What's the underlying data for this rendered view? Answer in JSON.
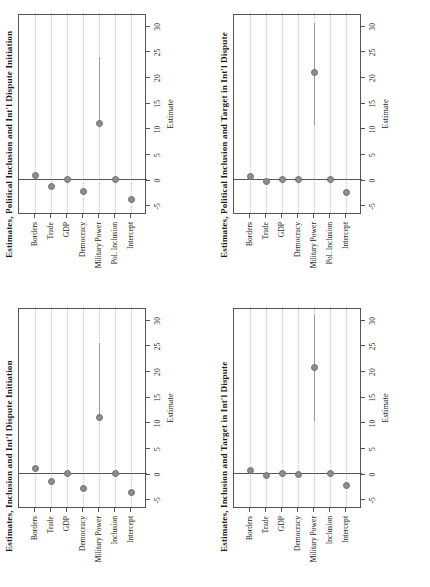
{
  "figure": {
    "orientation": "rotated-90-ccw",
    "panel_count": 4,
    "dot_color": "#8d8d8d",
    "ci_color": "#9a9a9a",
    "axis_color": "#555555",
    "grid_color": "#c9c9c9"
  },
  "axis": {
    "x_title": "Estimate",
    "ticks": [
      -5,
      0,
      5,
      10,
      15,
      20,
      25,
      30
    ],
    "tick_labels": [
      "-5",
      "0",
      "5",
      "10",
      "15",
      "20",
      "25",
      "30"
    ],
    "min": -6.5,
    "max": 32.5
  },
  "chart_data": [
    {
      "id": "panel-top-left",
      "type": "scatter",
      "title": "Estimates, Political Inclusion and Int'l Dispute Initiation",
      "xlabel": "Estimate",
      "ylabel": "",
      "xlim": [
        -6.5,
        32.5
      ],
      "grid": true,
      "categories": [
        "Borders",
        "Trade",
        "GDP",
        "Democracy",
        "Military Power",
        "Pol. Inclusion",
        "Intercept"
      ],
      "values": [
        0.9,
        -1.3,
        0.0,
        -2.3,
        11.0,
        0.0,
        -3.9
      ],
      "ci_low": [
        0.9,
        -1.3,
        0.0,
        -2.3,
        11.0,
        0.0,
        -3.9
      ],
      "ci_high": [
        0.9,
        -1.3,
        0.0,
        -2.3,
        24.0,
        0.0,
        -3.9
      ],
      "reference_line": 0
    },
    {
      "id": "panel-top-right",
      "type": "scatter",
      "title": "Estimates, Political Inclusion and Target in Int'l Dispute",
      "xlabel": "Estimate",
      "ylabel": "",
      "xlim": [
        -6.5,
        32.5
      ],
      "grid": true,
      "categories": [
        "Borders",
        "Trade",
        "GDP",
        "Democracy",
        "Military Power",
        "Pol. Inclusion",
        "Intercept"
      ],
      "values": [
        0.6,
        -0.3,
        0.0,
        0.0,
        20.8,
        0.0,
        -2.6
      ],
      "ci_low": [
        0.6,
        -0.3,
        0.0,
        0.0,
        10.5,
        0.0,
        -2.6
      ],
      "ci_high": [
        0.6,
        -0.3,
        0.0,
        0.0,
        30.5,
        0.0,
        -2.6
      ],
      "reference_line": 0
    },
    {
      "id": "panel-bottom-left",
      "type": "scatter",
      "title": "Estimates, Inclusion and Int'l Dispute Initiation",
      "xlabel": "Estimate",
      "ylabel": "",
      "xlim": [
        -6.5,
        32.5
      ],
      "grid": true,
      "categories": [
        "Borders",
        "Trade",
        "GDP",
        "Democracy",
        "Military Power",
        "Inclusion",
        "Intercept"
      ],
      "values": [
        1.0,
        -1.6,
        0.0,
        -2.9,
        11.0,
        0.0,
        -3.7
      ],
      "ci_low": [
        1.0,
        -1.6,
        0.0,
        -2.9,
        11.0,
        0.0,
        -3.7
      ],
      "ci_high": [
        1.0,
        -1.6,
        0.0,
        -2.9,
        25.5,
        0.0,
        -3.7
      ],
      "reference_line": 0
    },
    {
      "id": "panel-bottom-right",
      "type": "scatter",
      "title": "Estimates, Inclusion and Target in Int'l Dispute",
      "xlabel": "Estimate",
      "ylabel": "",
      "xlim": [
        -6.5,
        32.5
      ],
      "grid": true,
      "categories": [
        "Borders",
        "Trade",
        "GDP",
        "Democracy",
        "Military Power",
        "Inclusion",
        "Intercept"
      ],
      "values": [
        0.6,
        -0.4,
        0.0,
        -0.2,
        20.7,
        0.0,
        -2.3
      ],
      "ci_low": [
        0.6,
        -0.4,
        0.0,
        -0.2,
        10.0,
        0.0,
        -2.3
      ],
      "ci_high": [
        0.6,
        -0.4,
        0.0,
        -0.2,
        31.0,
        0.0,
        -2.3
      ],
      "reference_line": 0
    }
  ]
}
